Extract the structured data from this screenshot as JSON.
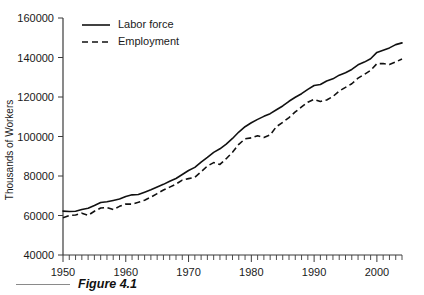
{
  "figure": {
    "caption": "Figure 4.1",
    "rule_name": "caption-rule"
  },
  "chart_data": {
    "type": "line",
    "title": "",
    "xlabel": "",
    "ylabel": "Thousands of Workers",
    "xlim": [
      1950,
      2004
    ],
    "ylim": [
      40000,
      160000
    ],
    "grid": false,
    "legend_position": "top-left",
    "y_ticks": [
      40000,
      60000,
      80000,
      100000,
      120000,
      140000,
      160000
    ],
    "y_tick_labels": [
      "40000",
      "60000",
      "80000",
      "100000",
      "120000",
      "140000",
      "160000"
    ],
    "x_ticks": [
      1950,
      1960,
      1970,
      1980,
      1990,
      2000
    ],
    "x_tick_labels": [
      "1950",
      "1960",
      "1970",
      "1980",
      "1990",
      "2000"
    ],
    "x_minor_tick_interval": 1,
    "x": [
      1950,
      1951,
      1952,
      1953,
      1954,
      1955,
      1956,
      1957,
      1958,
      1959,
      1960,
      1961,
      1962,
      1963,
      1964,
      1965,
      1966,
      1967,
      1968,
      1969,
      1970,
      1971,
      1972,
      1973,
      1974,
      1975,
      1976,
      1977,
      1978,
      1979,
      1980,
      1981,
      1982,
      1983,
      1984,
      1985,
      1986,
      1987,
      1988,
      1989,
      1990,
      1991,
      1992,
      1993,
      1994,
      1995,
      1996,
      1997,
      1998,
      1999,
      2000,
      2001,
      2002,
      2003,
      2004
    ],
    "series": [
      {
        "name": "Labor force",
        "style": "solid",
        "color": "#111111",
        "values": [
          62208,
          62017,
          62138,
          63015,
          63643,
          65023,
          66552,
          66929,
          67639,
          68369,
          69628,
          70459,
          70614,
          71833,
          73091,
          74455,
          75770,
          77347,
          78737,
          80734,
          82771,
          84382,
          87034,
          89429,
          91949,
          93775,
          96158,
          99009,
          102251,
          104962,
          106940,
          108670,
          110204,
          111550,
          113544,
          115461,
          117834,
          119865,
          121669,
          123869,
          125840,
          126346,
          128105,
          129200,
          131056,
          132304,
          133943,
          136297,
          137673,
          139368,
          142583,
          143734,
          144863,
          146510,
          147401
        ]
      },
      {
        "name": "Employment",
        "style": "dashed",
        "color": "#111111",
        "values": [
          58918,
          59961,
          60250,
          61179,
          60109,
          62170,
          63799,
          64071,
          63036,
          64630,
          65778,
          65746,
          66702,
          67762,
          69305,
          71088,
          72895,
          74372,
          75920,
          77902,
          78678,
          79367,
          82153,
          85064,
          86794,
          85846,
          88752,
          92017,
          96048,
          98824,
          99303,
          100397,
          99526,
          100834,
          105005,
          107150,
          109597,
          112440,
          114968,
          117342,
          118793,
          117718,
          118492,
          120259,
          123060,
          124900,
          126708,
          129558,
          131463,
          133488,
          136891,
          136933,
          136485,
          137736,
          139252
        ]
      }
    ]
  },
  "axis": {
    "y_title": "Thousands of Workers"
  },
  "legend": {
    "items": [
      {
        "label": "Labor force",
        "style": "solid"
      },
      {
        "label": "Employment",
        "style": "dashed"
      }
    ]
  }
}
